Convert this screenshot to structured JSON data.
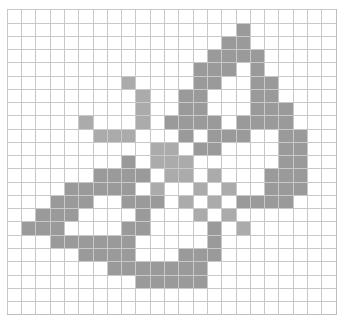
{
  "grid": {
    "rows": 23,
    "cols": 23,
    "colors": {
      "dark": "#9a9a9a",
      "light": "#ababab",
      "empty": "#ffffff",
      "line": "#c8c8c8"
    },
    "subject": "butterfly pixel pattern",
    "filled": {
      "1": {
        "D": [
          16
        ],
        "L": []
      },
      "2": {
        "D": [
          15,
          16
        ],
        "L": []
      },
      "3": {
        "D": [
          14,
          15,
          16,
          17
        ],
        "L": []
      },
      "4": {
        "D": [
          13,
          14,
          15,
          17
        ],
        "L": []
      },
      "5": {
        "D": [
          13,
          14,
          17,
          18
        ],
        "L": [
          8
        ]
      },
      "6": {
        "D": [
          12,
          13,
          17,
          18
        ],
        "L": [
          9
        ]
      },
      "7": {
        "D": [
          12,
          13,
          17,
          18,
          19
        ],
        "L": [
          9
        ]
      },
      "8": {
        "D": [
          11,
          12,
          13,
          14,
          16,
          17,
          18,
          19
        ],
        "L": [
          5,
          9
        ]
      },
      "9": {
        "D": [
          12,
          14,
          15,
          16,
          19,
          20
        ],
        "L": [
          6,
          7,
          8
        ]
      },
      "10": {
        "D": [
          13,
          14,
          19,
          20
        ],
        "L": [
          10,
          11
        ]
      },
      "11": {
        "D": [
          8,
          19,
          20
        ],
        "L": [
          10,
          11,
          12
        ]
      },
      "12": {
        "D": [
          6,
          7,
          8,
          9,
          18,
          19,
          20
        ],
        "L": [
          11,
          12,
          14
        ]
      },
      "13": {
        "D": [
          4,
          5,
          6,
          7,
          8,
          18,
          19,
          20
        ],
        "L": [
          10,
          13,
          15
        ]
      },
      "14": {
        "D": [
          3,
          4,
          5,
          8,
          9,
          10,
          16,
          17,
          18,
          19
        ],
        "L": [
          12,
          14
        ]
      },
      "15": {
        "D": [
          2,
          3,
          4,
          9
        ],
        "L": [
          13,
          15
        ]
      },
      "16": {
        "D": [
          1,
          2,
          3,
          8,
          9,
          14
        ],
        "L": [
          16
        ]
      },
      "17": {
        "D": [
          3,
          4,
          5,
          6,
          7,
          8,
          14
        ],
        "L": []
      },
      "18": {
        "D": [
          5,
          6,
          7,
          8,
          12,
          13,
          14
        ],
        "L": []
      },
      "19": {
        "D": [
          7,
          8,
          9,
          10,
          11,
          12,
          13
        ],
        "L": []
      },
      "20": {
        "D": [
          9,
          10,
          11,
          12,
          13
        ],
        "L": []
      }
    }
  }
}
